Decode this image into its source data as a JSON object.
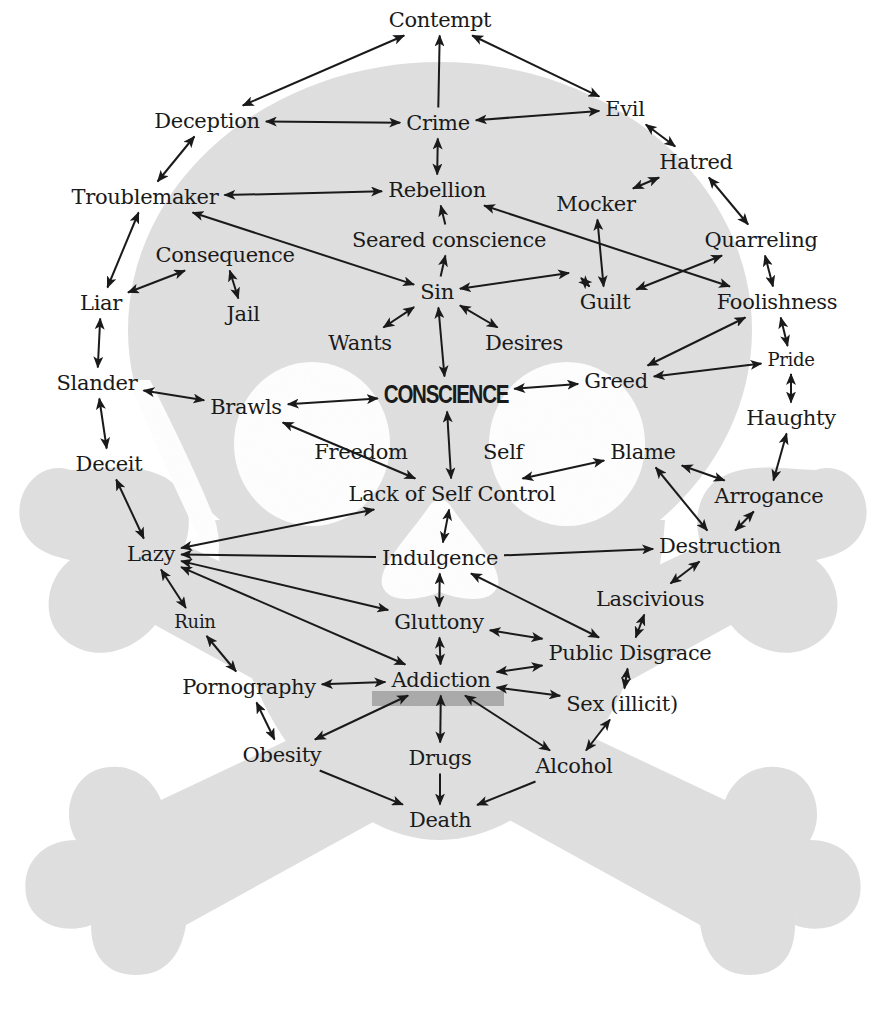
{
  "diagram": {
    "colors": {
      "skull_fill": "#e0e0e0",
      "hole_fill": "#ffffff",
      "mouth_bar": "#a9a9a9",
      "text": "#1a1a1a",
      "arrow": "#1a1a1a"
    },
    "nodes": [
      {
        "id": "contempt",
        "label": "Contempt"
      },
      {
        "id": "deception",
        "label": "Deception"
      },
      {
        "id": "crime",
        "label": "Crime"
      },
      {
        "id": "evil",
        "label": "Evil"
      },
      {
        "id": "hatred",
        "label": "Hatred"
      },
      {
        "id": "troublemaker",
        "label": "Troublemaker"
      },
      {
        "id": "rebellion",
        "label": "Rebellion"
      },
      {
        "id": "mocker",
        "label": "Mocker"
      },
      {
        "id": "seared",
        "label": "Seared conscience"
      },
      {
        "id": "quarreling",
        "label": "Quarreling"
      },
      {
        "id": "consequence",
        "label": "Consequence"
      },
      {
        "id": "liar",
        "label": "Liar"
      },
      {
        "id": "jail",
        "label": "Jail"
      },
      {
        "id": "sin",
        "label": "Sin"
      },
      {
        "id": "guilt",
        "label": "Guilt"
      },
      {
        "id": "foolishness",
        "label": "Foolishness"
      },
      {
        "id": "wants",
        "label": "Wants"
      },
      {
        "id": "desires",
        "label": "Desires"
      },
      {
        "id": "pride",
        "label": "Pride"
      },
      {
        "id": "slander",
        "label": "Slander"
      },
      {
        "id": "brawls",
        "label": "Brawls"
      },
      {
        "id": "conscience",
        "label": "CONSCIENCE"
      },
      {
        "id": "greed",
        "label": "Greed"
      },
      {
        "id": "haughty",
        "label": "Haughty"
      },
      {
        "id": "deceit",
        "label": "Deceit"
      },
      {
        "id": "freedom",
        "label": "Freedom"
      },
      {
        "id": "self",
        "label": "Self"
      },
      {
        "id": "blame",
        "label": "Blame"
      },
      {
        "id": "lack",
        "label": "Lack of Self Control"
      },
      {
        "id": "arrogance",
        "label": "Arrogance"
      },
      {
        "id": "lazy",
        "label": "Lazy"
      },
      {
        "id": "indulgence",
        "label": "Indulgence"
      },
      {
        "id": "destruction",
        "label": "Destruction"
      },
      {
        "id": "ruin",
        "label": "Ruin"
      },
      {
        "id": "lascivious",
        "label": "Lascivious"
      },
      {
        "id": "gluttony",
        "label": "Gluttony"
      },
      {
        "id": "public",
        "label": "Public Disgrace"
      },
      {
        "id": "pornography",
        "label": "Pornography"
      },
      {
        "id": "addiction",
        "label": "Addiction"
      },
      {
        "id": "sex",
        "label": "Sex (illicit)"
      },
      {
        "id": "obesity",
        "label": "Obesity"
      },
      {
        "id": "drugs",
        "label": "Drugs"
      },
      {
        "id": "alcohol",
        "label": "Alcohol"
      },
      {
        "id": "death",
        "label": "Death"
      }
    ],
    "edges": [
      {
        "from": "crime",
        "to": "contempt",
        "dir": "forward"
      },
      {
        "from": "contempt",
        "to": "evil",
        "dir": "both"
      },
      {
        "from": "deception",
        "to": "contempt",
        "dir": "both"
      },
      {
        "from": "deception",
        "to": "crime",
        "dir": "both"
      },
      {
        "from": "crime",
        "to": "evil",
        "dir": "both"
      },
      {
        "from": "crime",
        "to": "rebellion",
        "dir": "both"
      },
      {
        "from": "evil",
        "to": "hatred",
        "dir": "both"
      },
      {
        "from": "deception",
        "to": "troublemaker",
        "dir": "both"
      },
      {
        "from": "troublemaker",
        "to": "rebellion",
        "dir": "both"
      },
      {
        "from": "troublemaker",
        "to": "sin",
        "dir": "both"
      },
      {
        "from": "hatred",
        "to": "mocker",
        "dir": "both"
      },
      {
        "from": "hatred",
        "to": "quarreling",
        "dir": "both"
      },
      {
        "from": "rebellion",
        "to": "foolishness",
        "dir": "both"
      },
      {
        "from": "seared",
        "to": "rebellion",
        "dir": "forward"
      },
      {
        "from": "sin",
        "to": "seared",
        "dir": "forward"
      },
      {
        "from": "mocker",
        "to": "guilt",
        "dir": "both"
      },
      {
        "from": "troublemaker",
        "to": "liar",
        "dir": "both"
      },
      {
        "from": "consequence",
        "to": "liar",
        "dir": "both"
      },
      {
        "from": "consequence",
        "to": "jail",
        "dir": "both"
      },
      {
        "from": "sin",
        "to": "seared-right",
        "dir": "both"
      },
      {
        "from": "seared-right",
        "to": "guilt",
        "dir": "both"
      },
      {
        "from": "quarreling",
        "to": "guilt",
        "dir": "both"
      },
      {
        "from": "quarreling",
        "to": "foolishness",
        "dir": "both"
      },
      {
        "from": "sin",
        "to": "wants",
        "dir": "both"
      },
      {
        "from": "sin",
        "to": "desires",
        "dir": "both"
      },
      {
        "from": "sin",
        "to": "conscience",
        "dir": "both"
      },
      {
        "from": "foolishness",
        "to": "greed",
        "dir": "both"
      },
      {
        "from": "foolishness",
        "to": "pride",
        "dir": "both"
      },
      {
        "from": "liar",
        "to": "slander",
        "dir": "both"
      },
      {
        "from": "slander",
        "to": "brawls",
        "dir": "both"
      },
      {
        "from": "brawls",
        "to": "conscience",
        "dir": "both"
      },
      {
        "from": "conscience",
        "to": "greed",
        "dir": "both"
      },
      {
        "from": "greed",
        "to": "pride",
        "dir": "both"
      },
      {
        "from": "pride",
        "to": "haughty",
        "dir": "both"
      },
      {
        "from": "slander",
        "to": "deceit",
        "dir": "both"
      },
      {
        "from": "brawls",
        "to": "lack",
        "dir": "both"
      },
      {
        "from": "conscience",
        "to": "lack",
        "dir": "both"
      },
      {
        "from": "haughty",
        "to": "arrogance",
        "dir": "both"
      },
      {
        "from": "lack",
        "to": "blame",
        "dir": "both"
      },
      {
        "from": "blame",
        "to": "arrogance",
        "dir": "both"
      },
      {
        "from": "blame",
        "to": "destruction",
        "dir": "both"
      },
      {
        "from": "deceit",
        "to": "lazy",
        "dir": "both"
      },
      {
        "from": "lack",
        "to": "lazy",
        "dir": "both"
      },
      {
        "from": "indulgence",
        "to": "lazy",
        "dir": "forward"
      },
      {
        "from": "lack",
        "to": "indulgence",
        "dir": "both"
      },
      {
        "from": "indulgence",
        "to": "destruction",
        "dir": "forward"
      },
      {
        "from": "arrogance",
        "to": "destruction",
        "dir": "both"
      },
      {
        "from": "lazy",
        "to": "ruin",
        "dir": "both"
      },
      {
        "from": "lazy",
        "to": "gluttony",
        "dir": "both"
      },
      {
        "from": "lazy",
        "to": "addiction",
        "dir": "both"
      },
      {
        "from": "indulgence",
        "to": "gluttony",
        "dir": "both"
      },
      {
        "from": "indulgence",
        "to": "public",
        "dir": "both"
      },
      {
        "from": "destruction",
        "to": "lascivious",
        "dir": "both"
      },
      {
        "from": "lascivious",
        "to": "public",
        "dir": "both"
      },
      {
        "from": "gluttony",
        "to": "public",
        "dir": "both"
      },
      {
        "from": "gluttony",
        "to": "addiction",
        "dir": "both"
      },
      {
        "from": "ruin",
        "to": "pornography",
        "dir": "both"
      },
      {
        "from": "pornography",
        "to": "addiction",
        "dir": "both"
      },
      {
        "from": "addiction",
        "to": "public",
        "dir": "both"
      },
      {
        "from": "addiction",
        "to": "sex",
        "dir": "both"
      },
      {
        "from": "public",
        "to": "sex",
        "dir": "both"
      },
      {
        "from": "pornography",
        "to": "obesity",
        "dir": "both"
      },
      {
        "from": "addiction",
        "to": "obesity",
        "dir": "both"
      },
      {
        "from": "addiction",
        "to": "drugs",
        "dir": "both"
      },
      {
        "from": "addiction",
        "to": "alcohol",
        "dir": "both"
      },
      {
        "from": "sex",
        "to": "alcohol",
        "dir": "both"
      },
      {
        "from": "obesity",
        "to": "death",
        "dir": "forward"
      },
      {
        "from": "drugs",
        "to": "death",
        "dir": "forward"
      },
      {
        "from": "alcohol",
        "to": "death",
        "dir": "forward"
      }
    ]
  }
}
